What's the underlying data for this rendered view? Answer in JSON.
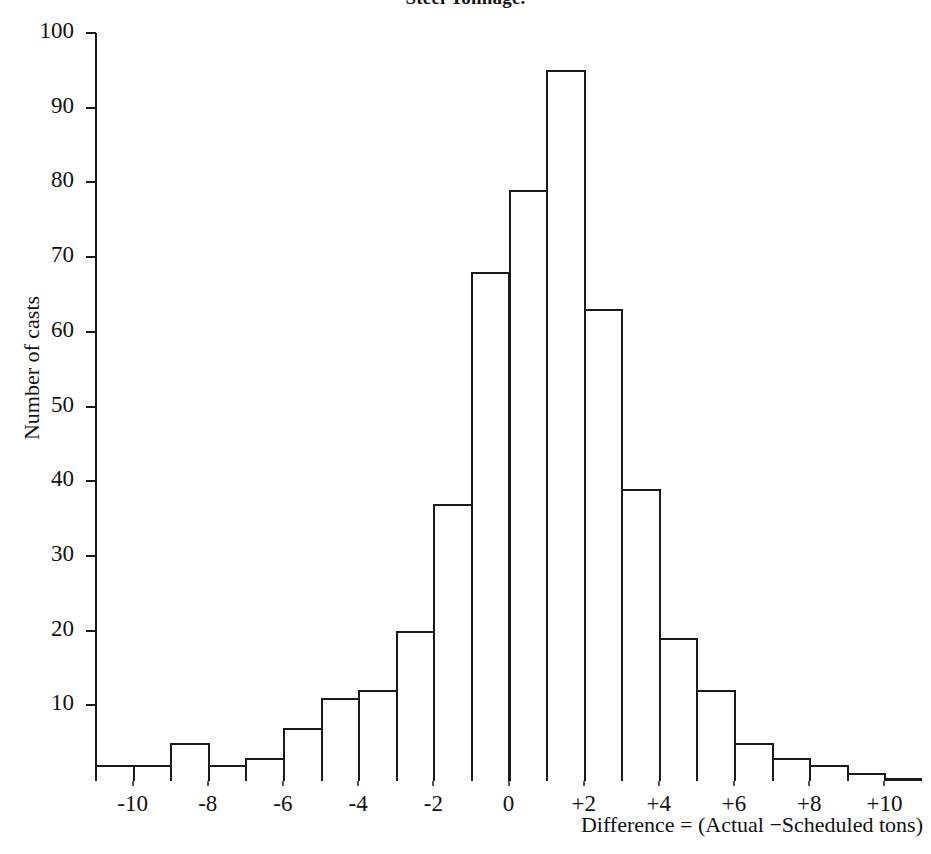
{
  "title": "Steel Tonnage.",
  "axis": {
    "y_title": "Number of casts",
    "x_caption": "Difference = (Actual −Scheduled tons)"
  },
  "chart_data": {
    "type": "bar",
    "title": "Steel Tonnage.",
    "xlabel": "Difference = (Actual −Scheduled tons)",
    "ylabel": "Number of casts",
    "ylim": [
      0,
      100
    ],
    "xlim": [
      -11,
      10
    ],
    "grid": false,
    "legend": "none",
    "bin_width": 1,
    "y_ticks": [
      100,
      90,
      80,
      70,
      60,
      50,
      40,
      30,
      20,
      10
    ],
    "y_tick_labels": [
      "100",
      "90",
      "80",
      "70",
      "60",
      "50",
      "40",
      "30",
      "20",
      "10"
    ],
    "x_ticks": [
      -10,
      -8,
      -6,
      -4,
      -2,
      0,
      2,
      4,
      6,
      8,
      10
    ],
    "x_tick_labels": [
      "-10",
      "-8",
      "-6",
      "-4",
      "-2",
      "0",
      "+2",
      "+4",
      "+6",
      "+8",
      "+10"
    ],
    "categories": [
      "-11",
      "-10",
      "-9",
      "-8",
      "-7",
      "-6",
      "-5",
      "-4",
      "-3",
      "-2",
      "-1",
      "0",
      "+1",
      "+2",
      "+3",
      "+4",
      "+5",
      "+6",
      "+7",
      "+8",
      "+9"
    ],
    "bin_starts": [
      -11,
      -10,
      -9,
      -8,
      -7,
      -6,
      -5,
      -4,
      -3,
      -2,
      -1,
      0,
      1,
      2,
      3,
      4,
      5,
      6,
      7,
      8,
      9
    ],
    "values": [
      2,
      2,
      5,
      2,
      3,
      7,
      11,
      12,
      20,
      37,
      68,
      79,
      95,
      63,
      39,
      19,
      12,
      5,
      3,
      2,
      1
    ]
  }
}
